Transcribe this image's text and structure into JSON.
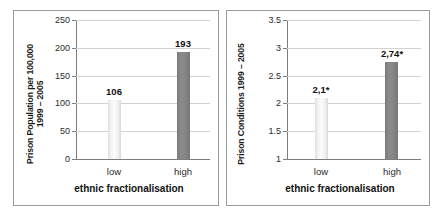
{
  "figure": {
    "panels": [
      "prison-population",
      "prison-conditions"
    ]
  },
  "chart_data": [
    {
      "type": "bar",
      "title": "",
      "ylabel": "Prison Population per 100,000\n1999 – 2005",
      "ylabel_line1": "Prison Population per 100,000",
      "ylabel_line2": "1999 – 2005",
      "xlabel": "ethnic fractionalisation",
      "categories": [
        "low",
        "high"
      ],
      "values": [
        106,
        193
      ],
      "value_labels": [
        "106",
        "193"
      ],
      "ylim": [
        0,
        250
      ],
      "yticks": [
        0,
        50,
        100,
        150,
        200,
        250
      ],
      "ytick_labels": [
        "0",
        "50",
        "100",
        "150",
        "200",
        "250"
      ],
      "grid": true,
      "legend": "none",
      "bar_colors": [
        "#f2f2f2",
        "#808080"
      ]
    },
    {
      "type": "bar",
      "title": "",
      "ylabel": "Prison Conditions 1999 – 2005",
      "ylabel_line1": "Prison Conditions 1999 – 2005",
      "ylabel_line2": "",
      "xlabel": "ethnic fractionalisation",
      "categories": [
        "low",
        "high"
      ],
      "values": [
        2.1,
        2.74
      ],
      "value_labels": [
        "2,1*",
        "2,74*"
      ],
      "ylim": [
        1,
        3.5
      ],
      "yticks": [
        1,
        1.5,
        2,
        2.5,
        3,
        3.5
      ],
      "ytick_labels": [
        "1",
        "1.5",
        "2",
        "2.5",
        "3",
        "3.5"
      ],
      "grid": true,
      "legend": "none",
      "bar_colors": [
        "#f2f2f2",
        "#808080"
      ]
    }
  ]
}
